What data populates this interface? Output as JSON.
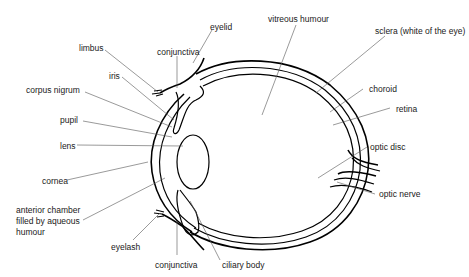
{
  "diagram": {
    "labels": {
      "eyelid": "eyelid",
      "limbus": "limbus",
      "conjunctiva_top": "conjunctiva",
      "iris": "iris",
      "corpus_nigrum": "corpus nigrum",
      "pupil": "pupil",
      "lens": "lens",
      "cornea": "cornea",
      "anterior_chamber_1": "anterior chamber",
      "anterior_chamber_2": "filled by aqueous",
      "anterior_chamber_3": "humour",
      "eyelash": "eyelash",
      "conjunctiva_bottom": "conjunctiva",
      "ciliary_body": "ciliary body",
      "vitreous_humour": "vitreous humour",
      "sclera": "sclera (white of the eye)",
      "choroid": "choroid",
      "retina": "retina",
      "optic_disc": "optic disc",
      "optic_nerve": "optic nerve"
    }
  }
}
